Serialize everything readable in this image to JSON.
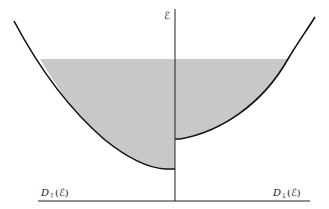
{
  "diagram": {
    "colors": {
      "curve": "#111111",
      "axis": "#222222",
      "fill": "#c8c8c8",
      "background": "#ffffff"
    },
    "axis": {
      "vertical_label": "ℰ",
      "left_label_main": "D",
      "left_label_sub": "↑",
      "left_label_arg": "(ℰ)",
      "right_label_main": "D",
      "right_label_sub": "↓",
      "right_label_arg": "(ℰ)"
    },
    "bands": [
      {
        "name": "spin-up band",
        "side": "left",
        "bottom_energy_px": 169,
        "filled_to_px": 59
      },
      {
        "name": "spin-down band",
        "side": "right",
        "bottom_energy_px": 139,
        "filled_to_px": 59
      }
    ]
  }
}
